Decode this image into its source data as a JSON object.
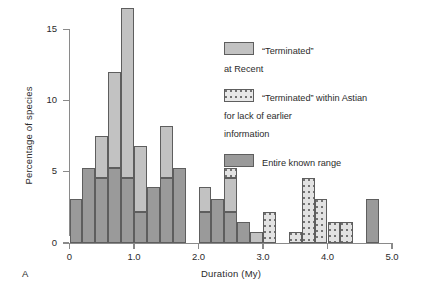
{
  "panel": {
    "label": "A"
  },
  "axes": {
    "xlabel": "Duration (My)",
    "ylabel": "Percentage of species",
    "xticks": [
      "0",
      "1.0",
      "2.0",
      "3.0",
      "4.0",
      "5.0"
    ],
    "yticks": [
      "0",
      "5",
      "10",
      "15"
    ]
  },
  "legend": {
    "items": [
      {
        "key": "recent",
        "label": "“Terminated”\nat Recent",
        "color": "#c2c2c2"
      },
      {
        "key": "astian",
        "label": "“Terminated” within Astian\nfor lack of earlier\ninformation",
        "color": "#e2e2e2"
      },
      {
        "key": "entire",
        "label": "Entire known range",
        "color": "#9a9a9a"
      }
    ]
  },
  "chart_data": {
    "type": "bar",
    "title": "",
    "subtitle": "",
    "xlabel": "Duration (My)",
    "ylabel": "Percentage of species",
    "xlim": [
      0,
      5.0
    ],
    "ylim": [
      0,
      17
    ],
    "xticks": [
      0,
      1.0,
      2.0,
      3.0,
      4.0,
      5.0
    ],
    "yticks": [
      0,
      5,
      10,
      15
    ],
    "grid": false,
    "legend_position": "upper-right",
    "bin_width": 0.2,
    "stacked": true,
    "series": [
      {
        "name": "Entire known range",
        "color": "#9a9a9a"
      },
      {
        "name": "“Terminated” at Recent",
        "color": "#c2c2c2"
      },
      {
        "name": "“Terminated” within Astian for lack of earlier information",
        "color": "#e2e2e2"
      }
    ],
    "bins": [
      {
        "x0": 0.0,
        "x1": 0.2,
        "entire": 3.1,
        "recent": 0.0,
        "astian": 0.0,
        "total": 3.1
      },
      {
        "x0": 0.2,
        "x1": 0.4,
        "entire": 5.3,
        "recent": 0.0,
        "astian": 0.0,
        "total": 5.3
      },
      {
        "x0": 0.4,
        "x1": 0.6,
        "entire": 4.6,
        "recent": 2.9,
        "astian": 0.0,
        "total": 7.5
      },
      {
        "x0": 0.6,
        "x1": 0.8,
        "entire": 5.3,
        "recent": 6.7,
        "astian": 0.0,
        "total": 12.0
      },
      {
        "x0": 0.8,
        "x1": 1.0,
        "entire": 4.6,
        "recent": 11.9,
        "astian": 0.0,
        "total": 16.5
      },
      {
        "x0": 1.0,
        "x1": 1.2,
        "entire": 2.2,
        "recent": 4.6,
        "astian": 0.0,
        "total": 6.8
      },
      {
        "x0": 1.2,
        "x1": 1.4,
        "entire": 3.9,
        "recent": 0.0,
        "astian": 0.0,
        "total": 3.9
      },
      {
        "x0": 1.4,
        "x1": 1.6,
        "entire": 4.6,
        "recent": 3.6,
        "astian": 0.0,
        "total": 8.2
      },
      {
        "x0": 1.6,
        "x1": 1.8,
        "entire": 5.3,
        "recent": 0.0,
        "astian": 0.0,
        "total": 5.3
      },
      {
        "x0": 1.8,
        "x1": 2.0,
        "entire": 0.0,
        "recent": 0.0,
        "astian": 0.0,
        "total": 0.0
      },
      {
        "x0": 2.0,
        "x1": 2.2,
        "entire": 2.2,
        "recent": 1.7,
        "astian": 0.0,
        "total": 3.9
      },
      {
        "x0": 2.2,
        "x1": 2.4,
        "entire": 3.1,
        "recent": 0.0,
        "astian": 0.0,
        "total": 3.1
      },
      {
        "x0": 2.4,
        "x1": 2.6,
        "entire": 2.2,
        "recent": 2.4,
        "astian": 0.7,
        "total": 5.3
      },
      {
        "x0": 2.6,
        "x1": 2.8,
        "entire": 1.5,
        "recent": 0.0,
        "astian": 0.0,
        "total": 1.5
      },
      {
        "x0": 2.8,
        "x1": 3.0,
        "entire": 0.0,
        "recent": 0.8,
        "astian": 0.0,
        "total": 0.8
      },
      {
        "x0": 3.0,
        "x1": 3.2,
        "entire": 0.0,
        "recent": 0.0,
        "astian": 2.2,
        "total": 2.2
      },
      {
        "x0": 3.2,
        "x1": 3.4,
        "entire": 0.0,
        "recent": 0.0,
        "astian": 0.0,
        "total": 0.0
      },
      {
        "x0": 3.4,
        "x1": 3.6,
        "entire": 0.0,
        "recent": 0.0,
        "astian": 0.8,
        "total": 0.8
      },
      {
        "x0": 3.6,
        "x1": 3.8,
        "entire": 0.0,
        "recent": 0.0,
        "astian": 4.6,
        "total": 4.6
      },
      {
        "x0": 3.8,
        "x1": 4.0,
        "entire": 0.0,
        "recent": 0.0,
        "astian": 3.1,
        "total": 3.1
      },
      {
        "x0": 4.0,
        "x1": 4.2,
        "entire": 0.0,
        "recent": 0.0,
        "astian": 1.5,
        "total": 1.5
      },
      {
        "x0": 4.2,
        "x1": 4.4,
        "entire": 0.0,
        "recent": 0.0,
        "astian": 1.5,
        "total": 1.5
      },
      {
        "x0": 4.4,
        "x1": 4.6,
        "entire": 0.0,
        "recent": 0.0,
        "astian": 0.0,
        "total": 0.0
      },
      {
        "x0": 4.6,
        "x1": 4.8,
        "entire": 3.1,
        "recent": 0.0,
        "astian": 0.0,
        "total": 3.1
      }
    ]
  }
}
